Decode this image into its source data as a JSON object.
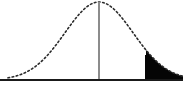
{
  "figure": {
    "title": "Normal distribution curve with shaded right tail rejection region",
    "type": "statistical-diagram",
    "background_color": "#ffffff"
  },
  "chart_data": {
    "type": "area",
    "title": "",
    "subtitle": "",
    "xlabel": "",
    "ylabel": "",
    "grid": false,
    "legend": false,
    "legend_position": "none",
    "xlim": [
      0,
      183
    ],
    "ylim": [
      0,
      104
    ],
    "curve": {
      "name": "normal-density",
      "distribution": "normal",
      "mean_px": 99,
      "stdev_px": 34,
      "peak_y_px": 2,
      "baseline_y_px": 80,
      "left_start_px": 8,
      "right_end_px": 183,
      "line_style": "dotted",
      "line_color": "#2b2b2b",
      "line_width": 1.6,
      "dash_pattern": "1.6 2.6",
      "x": [
        8,
        18,
        28,
        38,
        48,
        58,
        68,
        78,
        88,
        99,
        110,
        120,
        130,
        140,
        146,
        156,
        166,
        176,
        183
      ],
      "y": [
        79.2,
        78.2,
        75.9,
        71.3,
        63.4,
        51.9,
        38.3,
        25.0,
        13.9,
        2.0,
        13.9,
        25.0,
        38.3,
        51.9,
        58.0,
        68.9,
        75.0,
        78.3,
        79.4
      ]
    },
    "mean_line": {
      "name": "mean-line",
      "x_px": 99,
      "y_top_px": 2,
      "y_bottom_px": 80,
      "color": "#8c8c8c",
      "width": 2
    },
    "baseline": {
      "name": "x-axis-baseline",
      "y_px": 80,
      "x_start_px": 0,
      "x_end_px": 183,
      "color": "#1a1a1a",
      "width": 2.2
    },
    "shaded_region": {
      "name": "right-tail-rejection-region",
      "label": "",
      "fill_color": "#050505",
      "x_start_px": 146,
      "x_end_px": 183,
      "side": "right",
      "boundary_line": {
        "x_px": 146,
        "y_top_px": 55,
        "y_bottom_px": 80,
        "color": "#050505",
        "width": 2
      }
    }
  }
}
